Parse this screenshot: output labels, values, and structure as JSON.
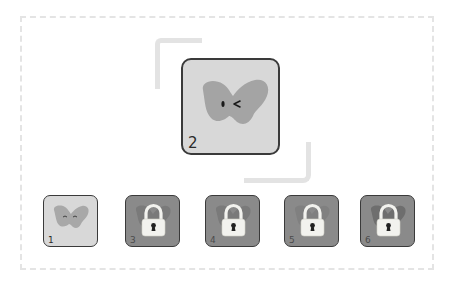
{
  "screen": {
    "title": "Level select",
    "colors": {
      "background": "#ffffff",
      "frame_dash": "#e4e4e4",
      "tile_unlocked": "#d8d8d8",
      "tile_locked": "#8a8a8a",
      "butterfly_unlocked": "#a4a4a4",
      "butterfly_locked": "#7a7a7a",
      "lock_body": "#f2f2ee",
      "tile_border": "#3a3a3a"
    }
  },
  "selected_level": {
    "number": "2",
    "state": "unlocked",
    "face": "wink"
  },
  "levels": [
    {
      "number": "1",
      "state": "unlocked",
      "face": "happy"
    },
    {
      "number": "3",
      "state": "locked"
    },
    {
      "number": "4",
      "state": "locked"
    },
    {
      "number": "5",
      "state": "locked"
    },
    {
      "number": "6",
      "state": "locked"
    }
  ]
}
